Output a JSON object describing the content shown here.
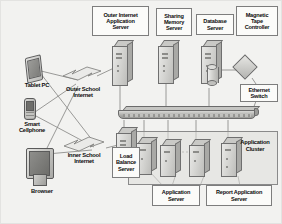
{
  "diagram": {
    "type": "network-architecture-diagram",
    "background_color": "#f2f2f0",
    "label_box_color": "#fbfbf9",
    "label_border_color": "#7d7d7d",
    "line_color": "#8f8f8c"
  },
  "labels": {
    "outer_internet_application_server": "Outer Internet\nApplication\nServer",
    "sharing_memory_server": "Sharing\nMemory\nServer",
    "database_server": "Database\nServer",
    "magnetic_tape_controller": "Magnetic\nTape\nController",
    "ethernet_switch": "Ethernet\nSwitch",
    "tablet_pc": "Tablet PC",
    "smart_cellphone": "Smart\nCellphone",
    "browser": "Browser",
    "outer_school_internet": "Outer School\nInternet",
    "inner_school_internet": "Inner School\nInternet",
    "load_balance_server": "Load\nBalance\nServer",
    "application_server": "Application\nServer",
    "report_application_server": "Report Application\nServer",
    "application_cluster": "Application\nCluster"
  },
  "nodes": [
    {
      "id": "tablet-pc",
      "icon": "tablet-icon",
      "label_ref": "tablet_pc",
      "zone": "client"
    },
    {
      "id": "smart-cellphone",
      "icon": "cellphone-icon",
      "label_ref": "smart_cellphone",
      "zone": "client"
    },
    {
      "id": "browser",
      "icon": "monitor-icon",
      "label_ref": "browser",
      "zone": "client"
    },
    {
      "id": "outer-school-internet",
      "icon": "internet-cloud-icon",
      "label_ref": "outer_school_internet",
      "zone": "network"
    },
    {
      "id": "inner-school-internet",
      "icon": "internet-cloud-icon",
      "label_ref": "inner_school_internet",
      "zone": "network"
    },
    {
      "id": "outer-internet-application-server",
      "icon": "tower-server-icon",
      "label_ref": "outer_internet_application_server",
      "zone": "server"
    },
    {
      "id": "sharing-memory-server",
      "icon": "tower-server-icon",
      "label_ref": "sharing_memory_server",
      "zone": "server"
    },
    {
      "id": "database-server",
      "icon": "tower-server-icon",
      "label_ref": "database_server",
      "zone": "server"
    },
    {
      "id": "magnetic-tape-controller",
      "icon": "diamond-controller-icon",
      "label_ref": "magnetic_tape_controller",
      "zone": "storage"
    },
    {
      "id": "ethernet-switch",
      "icon": "switch-bar-icon",
      "label_ref": "ethernet_switch",
      "zone": "network"
    },
    {
      "id": "load-balance-server",
      "icon": "tower-server-icon",
      "label_ref": "load_balance_server",
      "zone": "server"
    },
    {
      "id": "application-server",
      "icon": "tower-server-icon",
      "label_ref": "application_server",
      "zone": "cluster"
    },
    {
      "id": "report-application-server",
      "icon": "tower-server-icon",
      "label_ref": "report_application_server",
      "zone": "cluster"
    },
    {
      "id": "application-cluster",
      "icon": "group-box",
      "label_ref": "application_cluster",
      "zone": "cluster"
    }
  ],
  "connections": [
    {
      "from": "tablet-pc",
      "to": "outer-school-internet"
    },
    {
      "from": "smart-cellphone",
      "to": "outer-school-internet"
    },
    {
      "from": "browser",
      "to": "outer-school-internet"
    },
    {
      "from": "tablet-pc",
      "to": "inner-school-internet"
    },
    {
      "from": "smart-cellphone",
      "to": "inner-school-internet"
    },
    {
      "from": "browser",
      "to": "inner-school-internet"
    },
    {
      "from": "outer-school-internet",
      "to": "outer-internet-application-server"
    },
    {
      "from": "outer-internet-application-server",
      "to": "ethernet-switch"
    },
    {
      "from": "sharing-memory-server",
      "to": "ethernet-switch"
    },
    {
      "from": "database-server",
      "to": "ethernet-switch"
    },
    {
      "from": "database-server",
      "to": "magnetic-tape-controller"
    },
    {
      "from": "inner-school-internet",
      "to": "load-balance-server"
    },
    {
      "from": "load-balance-server",
      "to": "ethernet-switch"
    },
    {
      "from": "ethernet-switch",
      "to": "application-cluster"
    }
  ]
}
